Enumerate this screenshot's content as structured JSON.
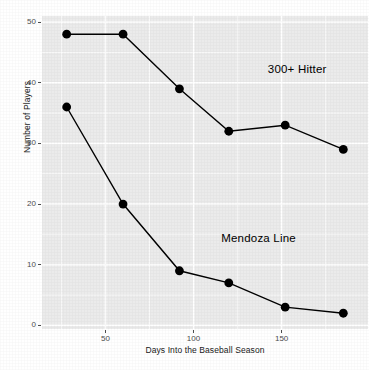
{
  "chart_data": {
    "type": "line",
    "title": "",
    "subtitle": "",
    "xlabel": "Days Into the Baseball Season",
    "ylabel": "Number of Players",
    "xlim": [
      14,
      199
    ],
    "ylim": [
      -0.6,
      51
    ],
    "grid": true,
    "legend_position": "inline-annotations",
    "panel_background": "#ebebeb",
    "gridline_color": "#ffffff",
    "series_color": "#000000",
    "x_ticks": [
      50,
      100,
      150
    ],
    "y_ticks": [
      0,
      10,
      20,
      30,
      40,
      50
    ],
    "x": [
      28,
      60,
      92,
      120,
      152,
      185
    ],
    "series": [
      {
        "name": "300+ Hitter",
        "values": [
          48,
          48,
          39,
          32,
          33,
          29
        ],
        "label_x": 185,
        "label_y": 42
      },
      {
        "name": "Mendoza Line",
        "values": [
          36,
          20,
          9,
          7,
          3,
          2
        ],
        "label_x": 137,
        "label_y": 14
      }
    ]
  }
}
